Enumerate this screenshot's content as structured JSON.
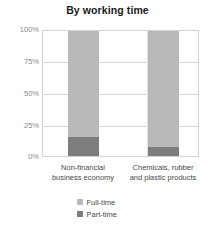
{
  "chart_data": {
    "type": "bar",
    "stacked": true,
    "title": "By working time",
    "xlabel": "",
    "ylabel": "",
    "ylim": [
      0,
      100
    ],
    "grid": true,
    "legend_position": "bottom",
    "categories": [
      "Non-financial business economy",
      "Chemicals, rubber and plastic products"
    ],
    "category_lines": [
      [
        "Non-financial",
        "business economy"
      ],
      [
        "Chemicals, rubber",
        "and plastic products"
      ]
    ],
    "tick_labels": [
      "100%",
      "75%",
      "50%",
      "25%",
      "0%"
    ],
    "tick_values": [
      100,
      75,
      50,
      25,
      0
    ],
    "series": [
      {
        "name": "Full-time",
        "values": [
          85,
          93
        ],
        "color": "#b9b9b9"
      },
      {
        "name": "Part-time",
        "values": [
          15,
          7
        ],
        "color": "#7d7d7d"
      }
    ]
  },
  "legend": {
    "items": [
      {
        "label": "Full-time",
        "color": "#b9b9b9"
      },
      {
        "label": "Part-time",
        "color": "#7d7d7d"
      }
    ]
  },
  "colors": {
    "full_time": "#b9b9b9",
    "part_time": "#7d7d7d",
    "gridline": "#d8d8d8",
    "axis": "#d2d2d2",
    "tick_text": "#8a8a8a",
    "label_text": "#4a4a4a",
    "title_text": "#1a1a1a",
    "background": "#ffffff"
  }
}
